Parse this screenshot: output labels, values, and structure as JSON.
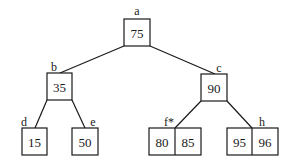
{
  "diagram": {
    "type": "tree",
    "nodes": [
      {
        "id": "a",
        "label": "a",
        "keys": [
          "75"
        ]
      },
      {
        "id": "b",
        "label": "b",
        "keys": [
          "35"
        ]
      },
      {
        "id": "c",
        "label": "c",
        "keys": [
          "90"
        ]
      },
      {
        "id": "d",
        "label": "d",
        "keys": [
          "15"
        ]
      },
      {
        "id": "e",
        "label": "e",
        "keys": [
          "50"
        ]
      },
      {
        "id": "f",
        "label": "f*",
        "keys": [
          "80",
          "85"
        ]
      },
      {
        "id": "h",
        "label": "h",
        "keys": [
          "95",
          "96"
        ]
      }
    ],
    "edges": [
      {
        "from": "a",
        "to": "b"
      },
      {
        "from": "a",
        "to": "c"
      },
      {
        "from": "b",
        "to": "d"
      },
      {
        "from": "b",
        "to": "e"
      },
      {
        "from": "c",
        "to": "f"
      },
      {
        "from": "c",
        "to": "h"
      }
    ]
  }
}
